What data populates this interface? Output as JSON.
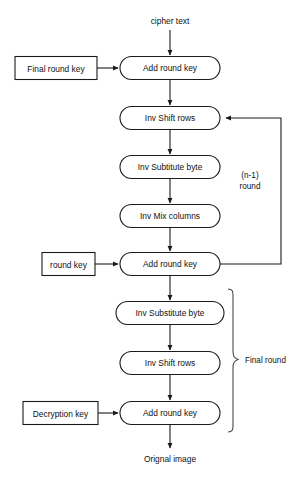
{
  "diagram": {
    "colors": {
      "background": "#ffffff",
      "stroke": "#1a1a1a",
      "text": "#111111",
      "brace": "#4a4a4a"
    },
    "io_labels": {
      "input": "cipher text",
      "output": "Orignal image"
    },
    "key_boxes": [
      {
        "id": "final-round-key",
        "label": "Final round key"
      },
      {
        "id": "round-key",
        "label": "round key"
      },
      {
        "id": "decryption-key",
        "label": "Decryption key"
      }
    ],
    "process_boxes": [
      {
        "id": "add-round-key-1",
        "label": "Add round key"
      },
      {
        "id": "inv-shift-rows-1",
        "label": "Inv Shift rows"
      },
      {
        "id": "inv-subtitute-byte",
        "label": "Inv Subtitute byte"
      },
      {
        "id": "inv-mix-columns",
        "label": "Inv Mix columns"
      },
      {
        "id": "add-round-key-2",
        "label": "Add round key"
      },
      {
        "id": "inv-substitute-byte",
        "label": "Inv Substitute byte"
      },
      {
        "id": "inv-shift-rows-2",
        "label": "Inv Shift rows"
      },
      {
        "id": "add-round-key-3",
        "label": "Add round key"
      }
    ],
    "annotations": [
      {
        "id": "loop-label",
        "line1": "(n-1)",
        "line2": "round"
      },
      {
        "id": "final-round-label",
        "text": "Final round"
      }
    ]
  }
}
